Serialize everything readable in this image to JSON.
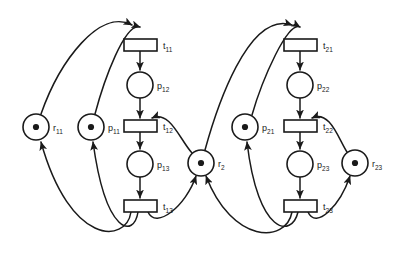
{
  "diagram": {
    "type": "petri-net",
    "colors": {
      "stroke": "#1a1a1a",
      "fill": "#ffffff",
      "token": "#1a1a1a",
      "background": "#ffffff"
    },
    "places": [
      {
        "id": "r11",
        "label": "r",
        "sub": "11",
        "cx": 36,
        "cy": 127,
        "r": 13,
        "tokens": 1,
        "label_x": 53,
        "label_y": 131
      },
      {
        "id": "p11",
        "label": "p",
        "sub": "11",
        "cx": 91,
        "cy": 127,
        "r": 13,
        "tokens": 1,
        "label_x": 108,
        "label_y": 131
      },
      {
        "id": "p12",
        "label": "p",
        "sub": "12",
        "cx": 140,
        "cy": 85,
        "r": 13,
        "tokens": 0,
        "label_x": 157,
        "label_y": 89
      },
      {
        "id": "p13",
        "label": "p",
        "sub": "13",
        "cx": 140,
        "cy": 164,
        "r": 13,
        "tokens": 0,
        "label_x": 157,
        "label_y": 168
      },
      {
        "id": "r2",
        "label": "r",
        "sub": "2",
        "cx": 201,
        "cy": 163,
        "r": 13,
        "tokens": 1,
        "label_x": 218,
        "label_y": 167
      },
      {
        "id": "p21",
        "label": "p",
        "sub": "21",
        "cx": 245,
        "cy": 127,
        "r": 13,
        "tokens": 1,
        "label_x": 262,
        "label_y": 131
      },
      {
        "id": "p22",
        "label": "p",
        "sub": "22",
        "cx": 300,
        "cy": 85,
        "r": 13,
        "tokens": 0,
        "label_x": 317,
        "label_y": 89
      },
      {
        "id": "p23",
        "label": "p",
        "sub": "23",
        "cx": 300,
        "cy": 164,
        "r": 13,
        "tokens": 0,
        "label_x": 317,
        "label_y": 168
      },
      {
        "id": "r23",
        "label": "r",
        "sub": "23",
        "cx": 355,
        "cy": 163,
        "r": 13,
        "tokens": 1,
        "label_x": 372,
        "label_y": 167
      }
    ],
    "transitions": [
      {
        "id": "t11",
        "label": "t",
        "sub": "11",
        "x": 124,
        "y": 39,
        "w": 33,
        "h": 12,
        "label_x": 163,
        "label_y": 49
      },
      {
        "id": "t12",
        "label": "t",
        "sub": "12",
        "x": 124,
        "y": 120,
        "w": 33,
        "h": 12,
        "label_x": 163,
        "label_y": 130
      },
      {
        "id": "t13",
        "label": "t",
        "sub": "13",
        "x": 124,
        "y": 200,
        "w": 33,
        "h": 12,
        "label_x": 163,
        "label_y": 210
      },
      {
        "id": "t21",
        "label": "t",
        "sub": "21",
        "x": 284,
        "y": 39,
        "w": 33,
        "h": 12,
        "label_x": 323,
        "label_y": 49
      },
      {
        "id": "t22",
        "label": "t",
        "sub": "22",
        "x": 284,
        "y": 120,
        "w": 33,
        "h": 12,
        "label_x": 323,
        "label_y": 130
      },
      {
        "id": "t23",
        "label": "t",
        "sub": "23",
        "x": 284,
        "y": 200,
        "w": 33,
        "h": 12,
        "label_x": 323,
        "label_y": 210
      }
    ],
    "arcs": [
      {
        "id": "a-r11-t11",
        "from": "r11",
        "to": "t11",
        "path": "M 41 114 C 60 60 100 8 132 25",
        "arrow": true
      },
      {
        "id": "a-p11-t11",
        "from": "p11",
        "to": "t11",
        "path": "M 95 114 C 104 80 125 22 140 27",
        "arrow": true
      },
      {
        "id": "a-t11-p12",
        "from": "t11",
        "to": "p12",
        "path": "M 140 51 L 140 70",
        "arrow": true
      },
      {
        "id": "a-p12-t12",
        "from": "p12",
        "to": "t12",
        "path": "M 140 177 L 140 177",
        "arrow": false
      },
      {
        "id": "a-p12-t12b",
        "from": "p12",
        "to": "t12",
        "path": "M 140 98 L 140 118",
        "arrow": true
      },
      {
        "id": "a-r2-t12",
        "from": "r2",
        "to": "t12",
        "path": "M 192 153 C 180 140 170 110 152 118",
        "arrow": true
      },
      {
        "id": "a-t12-p13",
        "from": "t12",
        "to": "p13",
        "path": "M 140 132 L 140 149",
        "arrow": true
      },
      {
        "id": "a-p13-t13",
        "from": "p13",
        "to": "t13",
        "path": "M 140 177 L 140 198",
        "arrow": true
      },
      {
        "id": "a-t13-r11",
        "from": "t13",
        "to": "r11",
        "path": "M 131 212 C 126 244 70 246 41 142",
        "arrow": true
      },
      {
        "id": "a-t13-p11",
        "from": "t13",
        "to": "p11",
        "path": "M 138 212 C 134 238 106 236 93 142",
        "arrow": true
      },
      {
        "id": "a-t13-r2",
        "from": "t13",
        "to": "r2",
        "path": "M 148 212 C 156 230 186 206 196 176",
        "arrow": true
      },
      {
        "id": "a-r2-t21",
        "from": "r2",
        "to": "t21",
        "path": "M 205 150 C 216 110 248 10 292 25",
        "arrow": true
      },
      {
        "id": "a-p21-t21",
        "from": "p21",
        "to": "t21",
        "path": "M 252 115 C 262 80 288 20 300 27",
        "arrow": true
      },
      {
        "id": "a-t21-p22",
        "from": "t21",
        "to": "p22",
        "path": "M 300 51 L 300 70",
        "arrow": true
      },
      {
        "id": "a-p22-t22",
        "from": "p22",
        "to": "t22",
        "path": "M 300 98 L 300 118",
        "arrow": true
      },
      {
        "id": "a-r23-t22",
        "from": "r23",
        "to": "t22",
        "path": "M 347 152 C 338 138 330 110 312 118",
        "arrow": true
      },
      {
        "id": "a-t22-p23",
        "from": "t22",
        "to": "p23",
        "path": "M 300 132 L 300 149",
        "arrow": true
      },
      {
        "id": "a-p23-t23",
        "from": "p23",
        "to": "t23",
        "path": "M 300 177 L 300 198",
        "arrow": true
      },
      {
        "id": "a-t23-r2",
        "from": "t23",
        "to": "r2",
        "path": "M 292 212 C 286 244 232 244 206 176",
        "arrow": true
      },
      {
        "id": "a-t23-p21",
        "from": "t23",
        "to": "p21",
        "path": "M 298 212 C 292 238 258 236 247 142",
        "arrow": true
      },
      {
        "id": "a-t23-r23",
        "from": "t23",
        "to": "r23",
        "path": "M 308 212 C 316 230 340 206 350 176",
        "arrow": true
      }
    ]
  }
}
